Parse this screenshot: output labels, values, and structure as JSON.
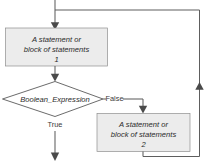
{
  "diagram": {
    "canvas": {
      "width": 208,
      "height": 164,
      "background": "#ffffff"
    },
    "colors": {
      "box_fill": "#ececec",
      "box_stroke": "#8f8f8f",
      "decision_fill": "#ffffff",
      "decision_stroke": "#5a5a5a",
      "connector": "#5e5e5e",
      "arrow": "#4a4a4a",
      "text": "#2b2b2b"
    },
    "nodes": {
      "statement_block_1": {
        "shape": "process",
        "line1": "A statement or",
        "line2": "block of statements",
        "line3": "1"
      },
      "decision": {
        "shape": "diamond",
        "label": "Boolean_Expression"
      },
      "statement_block_2": {
        "shape": "process",
        "line1": "A statement or",
        "line2": "block of statements",
        "line3": "2"
      }
    },
    "edge_labels": {
      "true_branch": "True",
      "false_branch": "False"
    }
  }
}
